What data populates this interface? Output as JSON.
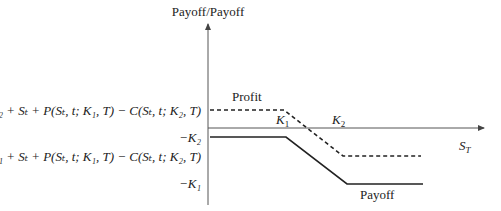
{
  "diagram": {
    "type": "payoff-diagram",
    "y_axis_label": "Payoff/Payoff",
    "x_axis_label": {
      "main": "S",
      "sub": "T"
    },
    "strike_labels": [
      {
        "main": "K",
        "sub": "1"
      },
      {
        "main": "K",
        "sub": "2"
      }
    ],
    "y_levels": [
      {
        "id": "profit_high",
        "text": "−K₂ + Sₜ + P(Sₜ, t; K₁, T) − C(Sₜ, t; K₂, T)"
      },
      {
        "id": "payoff_high",
        "text": "−K₂"
      },
      {
        "id": "profit_low",
        "text": "−K₁ + Sₜ + P(Sₜ, t; K₁, T) − C(Sₜ, t; K₂, T)"
      },
      {
        "id": "payoff_low",
        "text": "−K₁"
      }
    ],
    "curves": [
      {
        "name": "Profit",
        "style": "dashed",
        "label": "Profit"
      },
      {
        "name": "Payoff",
        "style": "solid",
        "label": "Payoff"
      }
    ],
    "colors": {
      "line": "#222222",
      "axis": "#555555"
    }
  }
}
